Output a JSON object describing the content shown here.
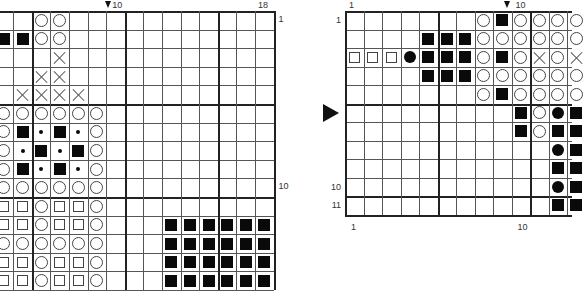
{
  "left_chart": {
    "origin_x": 255,
    "origin_y": 11,
    "cell": 18.6,
    "first_visible_col": 4,
    "last_col": 18,
    "rows": 15,
    "thick_cols_after": [
      5,
      10,
      15
    ],
    "thick_rows_after": [
      5,
      10
    ],
    "col_labels": [
      {
        "col": 10,
        "text": "10",
        "marker": true
      },
      {
        "col": 18,
        "text": "18"
      }
    ],
    "row_labels": [
      {
        "row": 1,
        "text": "1"
      },
      {
        "row": 10,
        "text": "10"
      }
    ],
    "cells": [
      {
        "r": 1,
        "c": 6,
        "s": "circle"
      },
      {
        "r": 1,
        "c": 7,
        "s": "circle"
      },
      {
        "r": 2,
        "c": 4,
        "s": "fsquare"
      },
      {
        "r": 2,
        "c": 5,
        "s": "fsquare"
      },
      {
        "r": 2,
        "c": 6,
        "s": "circle"
      },
      {
        "r": 2,
        "c": 7,
        "s": "circle"
      },
      {
        "r": 3,
        "c": 7,
        "s": "cross"
      },
      {
        "r": 4,
        "c": 6,
        "s": "cross"
      },
      {
        "r": 4,
        "c": 7,
        "s": "cross"
      },
      {
        "r": 5,
        "c": 5,
        "s": "cross"
      },
      {
        "r": 5,
        "c": 6,
        "s": "cross"
      },
      {
        "r": 5,
        "c": 7,
        "s": "cross"
      },
      {
        "r": 5,
        "c": 8,
        "s": "cross"
      },
      {
        "r": 6,
        "c": 4,
        "s": "circle"
      },
      {
        "r": 6,
        "c": 5,
        "s": "circle"
      },
      {
        "r": 6,
        "c": 6,
        "s": "circle"
      },
      {
        "r": 6,
        "c": 7,
        "s": "circle"
      },
      {
        "r": 6,
        "c": 8,
        "s": "circle"
      },
      {
        "r": 6,
        "c": 9,
        "s": "circle"
      },
      {
        "r": 7,
        "c": 4,
        "s": "circle"
      },
      {
        "r": 7,
        "c": 5,
        "s": "fsquare"
      },
      {
        "r": 7,
        "c": 6,
        "s": "dot"
      },
      {
        "r": 7,
        "c": 7,
        "s": "fsquare"
      },
      {
        "r": 7,
        "c": 8,
        "s": "dot"
      },
      {
        "r": 7,
        "c": 9,
        "s": "circle"
      },
      {
        "r": 8,
        "c": 4,
        "s": "circle"
      },
      {
        "r": 8,
        "c": 5,
        "s": "dot"
      },
      {
        "r": 8,
        "c": 6,
        "s": "fsquare"
      },
      {
        "r": 8,
        "c": 7,
        "s": "dot"
      },
      {
        "r": 8,
        "c": 8,
        "s": "fsquare"
      },
      {
        "r": 8,
        "c": 9,
        "s": "circle"
      },
      {
        "r": 9,
        "c": 4,
        "s": "circle"
      },
      {
        "r": 9,
        "c": 5,
        "s": "fsquare"
      },
      {
        "r": 9,
        "c": 6,
        "s": "dot"
      },
      {
        "r": 9,
        "c": 7,
        "s": "fsquare"
      },
      {
        "r": 9,
        "c": 8,
        "s": "dot"
      },
      {
        "r": 9,
        "c": 9,
        "s": "circle"
      },
      {
        "r": 10,
        "c": 4,
        "s": "circle"
      },
      {
        "r": 10,
        "c": 5,
        "s": "circle"
      },
      {
        "r": 10,
        "c": 6,
        "s": "circle"
      },
      {
        "r": 10,
        "c": 7,
        "s": "circle"
      },
      {
        "r": 10,
        "c": 8,
        "s": "circle"
      },
      {
        "r": 10,
        "c": 9,
        "s": "circle"
      },
      {
        "r": 11,
        "c": 4,
        "s": "square"
      },
      {
        "r": 11,
        "c": 5,
        "s": "square"
      },
      {
        "r": 11,
        "c": 6,
        "s": "circle"
      },
      {
        "r": 11,
        "c": 7,
        "s": "square"
      },
      {
        "r": 11,
        "c": 8,
        "s": "square"
      },
      {
        "r": 11,
        "c": 9,
        "s": "circle"
      },
      {
        "r": 12,
        "c": 4,
        "s": "square"
      },
      {
        "r": 12,
        "c": 5,
        "s": "square"
      },
      {
        "r": 12,
        "c": 6,
        "s": "circle"
      },
      {
        "r": 12,
        "c": 7,
        "s": "square"
      },
      {
        "r": 12,
        "c": 8,
        "s": "square"
      },
      {
        "r": 12,
        "c": 9,
        "s": "circle"
      },
      {
        "r": 13,
        "c": 4,
        "s": "circle"
      },
      {
        "r": 13,
        "c": 5,
        "s": "circle"
      },
      {
        "r": 13,
        "c": 6,
        "s": "circle"
      },
      {
        "r": 13,
        "c": 7,
        "s": "circle"
      },
      {
        "r": 13,
        "c": 8,
        "s": "circle"
      },
      {
        "r": 13,
        "c": 9,
        "s": "circle"
      },
      {
        "r": 14,
        "c": 4,
        "s": "square"
      },
      {
        "r": 14,
        "c": 5,
        "s": "square"
      },
      {
        "r": 14,
        "c": 6,
        "s": "circle"
      },
      {
        "r": 14,
        "c": 7,
        "s": "square"
      },
      {
        "r": 14,
        "c": 8,
        "s": "square"
      },
      {
        "r": 14,
        "c": 9,
        "s": "circle"
      },
      {
        "r": 15,
        "c": 4,
        "s": "square"
      },
      {
        "r": 15,
        "c": 5,
        "s": "square"
      },
      {
        "r": 15,
        "c": 6,
        "s": "circle"
      },
      {
        "r": 15,
        "c": 7,
        "s": "square"
      },
      {
        "r": 15,
        "c": 8,
        "s": "square"
      },
      {
        "r": 15,
        "c": 9,
        "s": "circle"
      },
      {
        "r": 12,
        "c": 13,
        "s": "fsquare"
      },
      {
        "r": 12,
        "c": 14,
        "s": "fsquare"
      },
      {
        "r": 12,
        "c": 15,
        "s": "fsquare"
      },
      {
        "r": 12,
        "c": 16,
        "s": "fsquare"
      },
      {
        "r": 12,
        "c": 17,
        "s": "fsquare"
      },
      {
        "r": 12,
        "c": 18,
        "s": "fsquare"
      },
      {
        "r": 13,
        "c": 13,
        "s": "fsquare"
      },
      {
        "r": 13,
        "c": 14,
        "s": "fsquare"
      },
      {
        "r": 13,
        "c": 15,
        "s": "fsquare"
      },
      {
        "r": 13,
        "c": 16,
        "s": "fsquare"
      },
      {
        "r": 13,
        "c": 17,
        "s": "fsquare"
      },
      {
        "r": 13,
        "c": 18,
        "s": "fsquare"
      },
      {
        "r": 14,
        "c": 13,
        "s": "fsquare"
      },
      {
        "r": 14,
        "c": 14,
        "s": "fsquare"
      },
      {
        "r": 14,
        "c": 15,
        "s": "fsquare"
      },
      {
        "r": 14,
        "c": 16,
        "s": "fsquare"
      },
      {
        "r": 14,
        "c": 17,
        "s": "fsquare"
      },
      {
        "r": 14,
        "c": 18,
        "s": "fsquare"
      },
      {
        "r": 15,
        "c": 13,
        "s": "fsquare"
      },
      {
        "r": 15,
        "c": 14,
        "s": "fsquare"
      },
      {
        "r": 15,
        "c": 15,
        "s": "fsquare"
      },
      {
        "r": 15,
        "c": 16,
        "s": "fsquare"
      },
      {
        "r": 15,
        "c": 17,
        "s": "fsquare"
      },
      {
        "r": 15,
        "c": 18,
        "s": "fsquare"
      }
    ]
  },
  "right_chart": {
    "origin_x": 345,
    "origin_y": 11,
    "cell": 18.5,
    "first_col": 1,
    "last_visible_col": 13,
    "rows": 11,
    "thick_cols_after": [
      5,
      10
    ],
    "thick_rows_after": [
      5,
      10
    ],
    "col_labels_top": [
      {
        "col": 1,
        "text": "1"
      },
      {
        "col": 10,
        "text": "10",
        "marker": true
      }
    ],
    "col_labels_bottom": [
      {
        "col": 1,
        "text": "1"
      },
      {
        "col": 10,
        "text": "10"
      }
    ],
    "row_labels": [
      {
        "row": 1,
        "text": "1"
      },
      {
        "row": 10,
        "text": "10"
      },
      {
        "row": 11,
        "text": "11"
      }
    ],
    "row_marker": {
      "row": 6
    },
    "cells": [
      {
        "r": 1,
        "c": 8,
        "s": "circle"
      },
      {
        "r": 1,
        "c": 9,
        "s": "fsquare"
      },
      {
        "r": 1,
        "c": 10,
        "s": "circle"
      },
      {
        "r": 1,
        "c": 11,
        "s": "circle"
      },
      {
        "r": 1,
        "c": 12,
        "s": "circle"
      },
      {
        "r": 1,
        "c": 13,
        "s": "circle"
      },
      {
        "r": 2,
        "c": 5,
        "s": "fsquare"
      },
      {
        "r": 2,
        "c": 6,
        "s": "fsquare"
      },
      {
        "r": 2,
        "c": 7,
        "s": "fsquare"
      },
      {
        "r": 2,
        "c": 8,
        "s": "circle"
      },
      {
        "r": 2,
        "c": 9,
        "s": "circle"
      },
      {
        "r": 2,
        "c": 10,
        "s": "circle"
      },
      {
        "r": 2,
        "c": 11,
        "s": "circle"
      },
      {
        "r": 2,
        "c": 12,
        "s": "circle"
      },
      {
        "r": 2,
        "c": 13,
        "s": "circle"
      },
      {
        "r": 3,
        "c": 1,
        "s": "square"
      },
      {
        "r": 3,
        "c": 2,
        "s": "square"
      },
      {
        "r": 3,
        "c": 3,
        "s": "square"
      },
      {
        "r": 3,
        "c": 4,
        "s": "fcircle"
      },
      {
        "r": 3,
        "c": 5,
        "s": "fsquare"
      },
      {
        "r": 3,
        "c": 6,
        "s": "fsquare"
      },
      {
        "r": 3,
        "c": 7,
        "s": "fsquare"
      },
      {
        "r": 3,
        "c": 8,
        "s": "circle"
      },
      {
        "r": 3,
        "c": 9,
        "s": "fsquare"
      },
      {
        "r": 3,
        "c": 10,
        "s": "circle"
      },
      {
        "r": 3,
        "c": 11,
        "s": "cross"
      },
      {
        "r": 3,
        "c": 12,
        "s": "circle"
      },
      {
        "r": 3,
        "c": 13,
        "s": "cross"
      },
      {
        "r": 4,
        "c": 5,
        "s": "fsquare"
      },
      {
        "r": 4,
        "c": 6,
        "s": "fsquare"
      },
      {
        "r": 4,
        "c": 7,
        "s": "fsquare"
      },
      {
        "r": 4,
        "c": 8,
        "s": "circle"
      },
      {
        "r": 4,
        "c": 9,
        "s": "circle"
      },
      {
        "r": 4,
        "c": 10,
        "s": "circle"
      },
      {
        "r": 4,
        "c": 11,
        "s": "circle"
      },
      {
        "r": 4,
        "c": 12,
        "s": "circle"
      },
      {
        "r": 4,
        "c": 13,
        "s": "circle"
      },
      {
        "r": 5,
        "c": 8,
        "s": "circle"
      },
      {
        "r": 5,
        "c": 9,
        "s": "fsquare"
      },
      {
        "r": 5,
        "c": 10,
        "s": "circle"
      },
      {
        "r": 5,
        "c": 11,
        "s": "circle"
      },
      {
        "r": 5,
        "c": 12,
        "s": "circle"
      },
      {
        "r": 5,
        "c": 13,
        "s": "circle"
      },
      {
        "r": 6,
        "c": 10,
        "s": "fsquare"
      },
      {
        "r": 6,
        "c": 11,
        "s": "circle"
      },
      {
        "r": 6,
        "c": 12,
        "s": "fcircle"
      },
      {
        "r": 6,
        "c": 13,
        "s": "fsquare"
      },
      {
        "r": 7,
        "c": 10,
        "s": "fsquare"
      },
      {
        "r": 7,
        "c": 11,
        "s": "circle"
      },
      {
        "r": 7,
        "c": 12,
        "s": "fsquare"
      },
      {
        "r": 7,
        "c": 13,
        "s": "fsquare"
      },
      {
        "r": 8,
        "c": 12,
        "s": "fcircle"
      },
      {
        "r": 8,
        "c": 13,
        "s": "fsquare"
      },
      {
        "r": 9,
        "c": 12,
        "s": "fsquare"
      },
      {
        "r": 9,
        "c": 13,
        "s": "fsquare"
      },
      {
        "r": 10,
        "c": 12,
        "s": "fcircle"
      },
      {
        "r": 10,
        "c": 13,
        "s": "fsquare"
      },
      {
        "r": 11,
        "c": 12,
        "s": "fsquare"
      },
      {
        "r": 11,
        "c": 13,
        "s": "fsquare"
      }
    ]
  }
}
